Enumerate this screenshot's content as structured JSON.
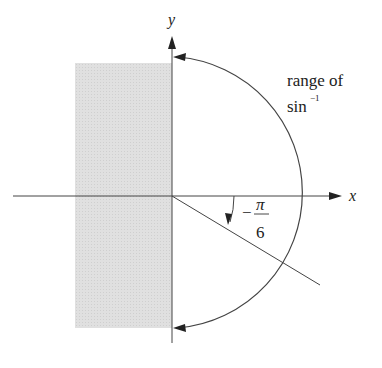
{
  "diagram": {
    "axes": {
      "x_label": "x",
      "y_label": "y"
    },
    "range_label": {
      "line1": "range of",
      "line2_base": "sin",
      "line2_sup": "−1"
    },
    "angle_label": {
      "sign": "−",
      "numerator": "π",
      "denominator": "6"
    },
    "shaded_region": "left half-plane strip",
    "colors": {
      "ink": "#333333",
      "shade": "#dcdcdc"
    }
  }
}
